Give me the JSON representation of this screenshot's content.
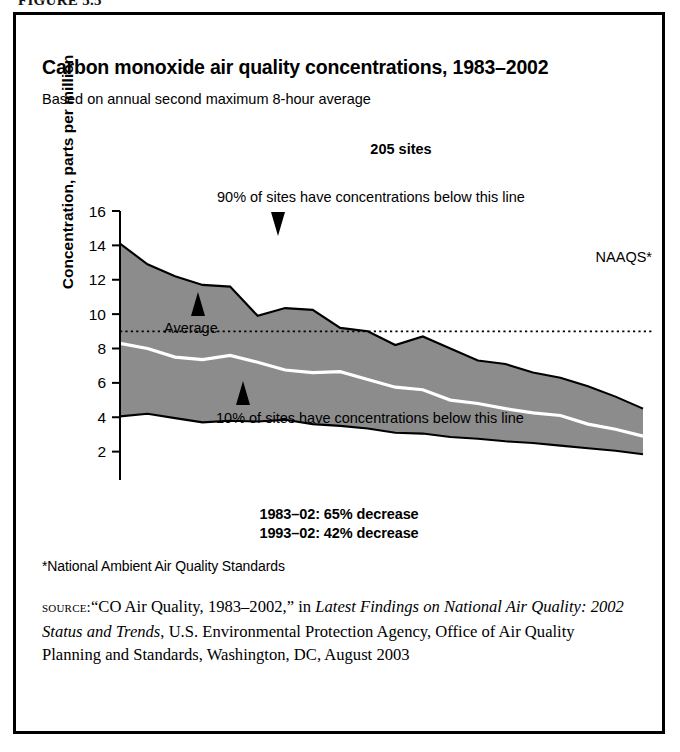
{
  "figure": {
    "number": "FIGURE 5.5"
  },
  "chart_header": {
    "title": "Carbon monoxide air quality concentrations, 1983–2002",
    "subtitle": "Based on annual second maximum 8-hour average"
  },
  "annotations": {
    "sites_count": "205 sites",
    "upper_band": "90% of sites have concentrations below this line",
    "lower_band": "10% of sites have concentrations below this line",
    "average": "Average",
    "naaqs": "NAAQS*",
    "decrease_1": "1983–02: 65% decrease",
    "decrease_2": "1993–02: 42% decrease"
  },
  "footnote": "*National Ambient Air Quality Standards",
  "source": {
    "label": "source:",
    "part1": "“CO Air Quality, 1983–2002,” in ",
    "italic1": "Latest Findings on National Air Quality: 2002 Status and Trends",
    "part2": ", U.S. Environmental Protection Agency, Office of Air Quality Planning and Standards, Washington, DC, August 2003"
  },
  "colors": {
    "band_fill": "#8c8c8c",
    "band_edge": "#000000",
    "average_line": "#ffffff",
    "naaqs_line": "#000000",
    "axis": "#000000",
    "background": "#ffffff"
  },
  "chart_data": {
    "type": "area",
    "title": "Carbon monoxide air quality concentrations, 1983–2002",
    "subtitle": "Based on annual second maximum 8-hour average",
    "xlabel": "",
    "ylabel": "Concentration, parts per million",
    "xlim": [
      1983,
      2002
    ],
    "ylim": [
      0,
      16
    ],
    "yticks": [
      0,
      2,
      4,
      6,
      8,
      10,
      12,
      14,
      16
    ],
    "ytick_labels": [
      "0",
      "2",
      "4",
      "6",
      "8",
      "10",
      "12",
      "14",
      "16"
    ],
    "grid": false,
    "legend": "none",
    "x": [
      1983,
      1984,
      1985,
      1986,
      1987,
      1988,
      1989,
      1990,
      1991,
      1992,
      1993,
      1994,
      1995,
      1996,
      1997,
      1998,
      1999,
      2000,
      2001,
      2002
    ],
    "categories": [
      "83",
      "84",
      "85",
      "86",
      "87",
      "88",
      "89",
      "90",
      "91",
      "92",
      "93",
      "94",
      "95",
      "96",
      "97",
      "98",
      "99",
      "00",
      "01",
      "02"
    ],
    "series": [
      {
        "name": "90% of sites have concentrations below this line",
        "role": "upper-bound",
        "values": [
          14.1,
          12.9,
          12.2,
          11.7,
          11.6,
          9.9,
          10.35,
          10.25,
          9.2,
          9.0,
          8.2,
          8.7,
          8.0,
          7.3,
          7.1,
          6.6,
          6.3,
          5.8,
          5.2,
          4.5
        ]
      },
      {
        "name": "Average",
        "role": "mean",
        "values": [
          8.3,
          8.0,
          7.5,
          7.35,
          7.6,
          7.2,
          6.75,
          6.6,
          6.65,
          6.2,
          5.75,
          5.6,
          5.0,
          4.8,
          4.5,
          4.25,
          4.1,
          3.6,
          3.3,
          2.9
        ]
      },
      {
        "name": "10% of sites have concentrations below this line",
        "role": "lower-bound",
        "values": [
          4.05,
          4.2,
          3.95,
          3.7,
          3.8,
          3.75,
          3.85,
          3.6,
          3.5,
          3.35,
          3.1,
          3.05,
          2.85,
          2.75,
          2.6,
          2.5,
          2.35,
          2.2,
          2.05,
          1.85
        ]
      }
    ],
    "reference_lines": [
      {
        "name": "NAAQS*",
        "value": 9.0,
        "style": "dotted"
      }
    ],
    "notes": [
      "205 sites",
      "1983–02: 65% decrease",
      "1993–02: 42% decrease"
    ]
  }
}
